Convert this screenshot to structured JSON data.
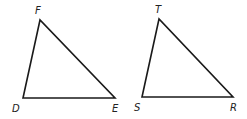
{
  "diagram": {
    "type": "geometry",
    "triangles": [
      {
        "name": "DEF",
        "vertices": [
          {
            "id": "F",
            "x": 40,
            "y": 20,
            "label_x": 35,
            "label_y": 14
          },
          {
            "id": "D",
            "x": 23,
            "y": 98,
            "label_x": 12,
            "label_y": 112
          },
          {
            "id": "E",
            "x": 115,
            "y": 98,
            "label_x": 112,
            "label_y": 112
          }
        ]
      },
      {
        "name": "STR",
        "vertices": [
          {
            "id": "T",
            "x": 159,
            "y": 19,
            "label_x": 155,
            "label_y": 13
          },
          {
            "id": "S",
            "x": 142,
            "y": 97,
            "label_x": 134,
            "label_y": 111
          },
          {
            "id": "R",
            "x": 233,
            "y": 97,
            "label_x": 230,
            "label_y": 111
          }
        ]
      }
    ],
    "colors": {
      "stroke": "#1a1a1a",
      "label": "#222222",
      "background": "#ffffff"
    }
  }
}
